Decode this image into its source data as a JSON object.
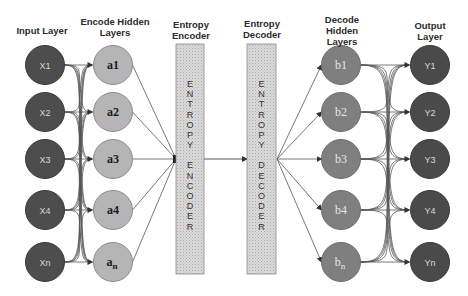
{
  "headers": {
    "input_layer": "Input Layer",
    "encode_hidden_line1": "Encode Hidden",
    "encode_hidden_line2": "Layers",
    "entropy_encoder_line1": "Entropy",
    "entropy_encoder_line2": "Encoder",
    "entropy_decoder_line1": "Entropy",
    "entropy_decoder_line2": "Decoder",
    "decode_hidden_line1": "Decode",
    "decode_hidden_line2": "Hidden",
    "decode_hidden_line3": "Layers",
    "output_line1": "Output",
    "output_line2": "Layer"
  },
  "input_nodes": [
    "X1",
    "X2",
    "X3",
    "X4",
    "Xn"
  ],
  "encode_nodes": [
    "a1",
    "a2",
    "a3",
    "a4",
    "a"
  ],
  "encode_last_subscript": "n",
  "decode_nodes": [
    "b1",
    "b2",
    "b3",
    "b4",
    "b"
  ],
  "decode_last_subscript": "n",
  "output_nodes": [
    "Y1",
    "Y2",
    "Y3",
    "Y4",
    "Yn"
  ],
  "encoder_box_letters": [
    "E",
    "N",
    "T",
    "R",
    "O",
    "P",
    "Y",
    "",
    "E",
    "N",
    "C",
    "O",
    "D",
    "E",
    "R"
  ],
  "decoder_box_letters": [
    "E",
    "N",
    "T",
    "R",
    "O",
    "P",
    "Y",
    "",
    "D",
    "E",
    "C",
    "O",
    "D",
    "E",
    "R"
  ],
  "colors": {
    "input_node": "#4d4d4d",
    "encode_node": "#b5b5b5",
    "decode_node": "#7f7f7f",
    "output_node": "#4a4a4a",
    "box_fill": "#d6d6d6",
    "line": "#555555"
  }
}
